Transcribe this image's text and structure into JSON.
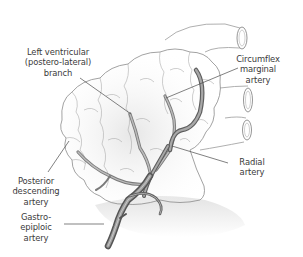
{
  "figure": {
    "colors": {
      "outline": "#8a8a8a",
      "vessel_fill": "#9a9a9a",
      "vessel_dark": "#5e5e5e",
      "leader_line": "#4a4a4a",
      "label_text": "#3a3a3a",
      "shading": "#d8d8d8"
    }
  },
  "labels": [
    {
      "id": "left-ventricular",
      "text": "Left ventricular\n(postero-lateral)\nbranch"
    },
    {
      "id": "circumflex-marginal",
      "text": "Circumflex\nmarginal\nartery"
    },
    {
      "id": "radial",
      "text": "Radial\nartery"
    },
    {
      "id": "posterior-descending",
      "text": "Posterior\ndescending\nartery"
    },
    {
      "id": "gastro-epiploic",
      "text": "Gastro-\nepiploic\nartery"
    }
  ]
}
